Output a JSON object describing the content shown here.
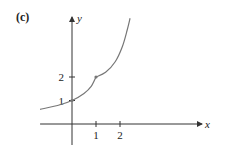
{
  "chart_data": {
    "type": "line",
    "panel_label": "(c)",
    "title": "",
    "xlabel": "x",
    "ylabel": "y",
    "xlim": [
      -1.33,
      5.5
    ],
    "ylim": [
      -0.9,
      4.6
    ],
    "grid": false,
    "x_ticks": [
      {
        "value": 1,
        "label": "1"
      },
      {
        "value": 2,
        "label": "2"
      }
    ],
    "y_ticks": [
      {
        "value": 1,
        "label": "1"
      },
      {
        "value": 2,
        "label": "2"
      }
    ],
    "series": [
      {
        "name": "left-branch",
        "points": [
          [
            -1.33,
            0.62
          ],
          [
            -0.5,
            0.82
          ],
          [
            0,
            1.0
          ],
          [
            0.5,
            1.3
          ],
          [
            0.8,
            1.6
          ],
          [
            1.0,
            2.0
          ]
        ]
      },
      {
        "name": "right-branch",
        "points": [
          [
            1.0,
            2.0
          ],
          [
            1.4,
            2.2
          ],
          [
            1.8,
            2.65
          ],
          [
            2.1,
            3.3
          ],
          [
            2.3,
            4.0
          ],
          [
            2.42,
            4.5
          ]
        ]
      }
    ],
    "marked_points": [
      {
        "x": 1,
        "y": 2
      },
      {
        "x": 0,
        "y": 1
      }
    ]
  }
}
